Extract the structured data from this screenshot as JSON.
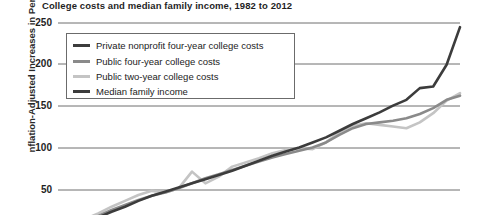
{
  "chart": {
    "title": "College costs and median family income, 1982 to 2012",
    "y_axis_label": "nflation-Adjusted Increases in Percent"
  },
  "legend": {
    "items": [
      {
        "label": "Private nonprofit four-year college costs",
        "color": "#3c3c3c"
      },
      {
        "label": "Public four-year college costs",
        "color": "#8a8a8a"
      },
      {
        "label": "Public two-year college costs",
        "color": "#c4c4c4"
      },
      {
        "label": "Median family income",
        "color": "#3c3c3c"
      }
    ]
  },
  "chart_data": {
    "type": "line",
    "title": "College costs and median family income, 1982 to 2012",
    "xlabel": "",
    "ylabel": "Inflation-Adjusted Increases in Percent",
    "xlim": [
      1982,
      2012
    ],
    "ylim": [
      0,
      260
    ],
    "yticks": [
      50,
      100,
      150,
      200,
      250
    ],
    "ytick_labels": [
      "50",
      "100",
      "150",
      "200",
      "250"
    ],
    "grid": true,
    "legend_position": "upper-left-inside",
    "x": [
      1982,
      1983,
      1984,
      1985,
      1986,
      1987,
      1988,
      1989,
      1990,
      1991,
      1992,
      1993,
      1994,
      1995,
      1996,
      1997,
      1998,
      1999,
      2000,
      2001,
      2002,
      2003,
      2004,
      2005,
      2006,
      2007,
      2008,
      2009,
      2010,
      2011,
      2012
    ],
    "series": [
      {
        "name": "Private nonprofit four-year college costs",
        "color": "#3c3c3c",
        "values": [
          0,
          5,
          11,
          17,
          24,
          30,
          37,
          43,
          48,
          53,
          58,
          63,
          68,
          73,
          79,
          85,
          91,
          96,
          101,
          107,
          113,
          121,
          129,
          136,
          143,
          151,
          158,
          172,
          174,
          200,
          245
        ]
      },
      {
        "name": "Public four-year college costs",
        "color": "#8a8a8a",
        "values": [
          0,
          6,
          13,
          19,
          26,
          32,
          38,
          43,
          47,
          52,
          58,
          64,
          69,
          74,
          79,
          84,
          89,
          93,
          97,
          101,
          107,
          116,
          124,
          129,
          131,
          133,
          136,
          141,
          148,
          158,
          163
        ]
      },
      {
        "name": "Public two-year college costs",
        "color": "#c4c4c4",
        "values": [
          0,
          7,
          15,
          22,
          30,
          37,
          44,
          49,
          47,
          52,
          72,
          58,
          66,
          78,
          83,
          88,
          94,
          98,
          100,
          99,
          107,
          119,
          127,
          130,
          128,
          126,
          124,
          131,
          142,
          157,
          166
        ]
      },
      {
        "name": "Median family income",
        "color": "#3c3c3c",
        "values": [
          0,
          1,
          3,
          4,
          5,
          6,
          7,
          8,
          7,
          6,
          6,
          6,
          7,
          8,
          9,
          10,
          12,
          13,
          14,
          13,
          12,
          12,
          12,
          12,
          13,
          14,
          12,
          10,
          9,
          9,
          10
        ]
      }
    ]
  }
}
